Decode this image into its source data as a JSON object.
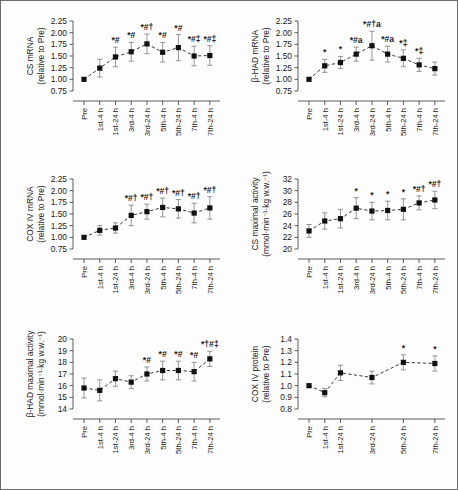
{
  "figure": {
    "name": "six-panel-exercise-training-figure",
    "background": "#ffffff",
    "border_color": "#6b6b6b",
    "marker_color": "#111111",
    "error_color": "#8a8a8a",
    "line_style": "dashed"
  },
  "chart_data": [
    {
      "id": "cs-mrna",
      "type": "line",
      "title": "",
      "ylabel": "CS mRNA\n(relative to Pre)",
      "ylabel_line1": "CS mRNA",
      "ylabel_line2": "(relative to Pre)",
      "xlabel": "",
      "ylim": [
        0.75,
        2.25
      ],
      "yticks": [
        0.75,
        1.0,
        1.25,
        1.5,
        1.75,
        2.0,
        2.25
      ],
      "ytick_labels": [
        "0.75",
        "1.00",
        "1.25",
        "1.50",
        "1.75",
        "2.00",
        "2.25"
      ],
      "categories": [
        "Pre",
        "1st-4 h",
        "1st-24 h",
        "3rd-4 h",
        "3rd-24 h",
        "5th-4 h",
        "5th-24 h",
        "7th-4 h",
        "7th-24 h"
      ],
      "values": [
        1.0,
        1.24,
        1.48,
        1.59,
        1.76,
        1.58,
        1.68,
        1.5,
        1.51
      ],
      "err_low": [
        0.0,
        0.19,
        0.21,
        0.2,
        0.21,
        0.21,
        0.28,
        0.21,
        0.21
      ],
      "err_high": [
        0.0,
        0.19,
        0.21,
        0.2,
        0.21,
        0.21,
        0.28,
        0.21,
        0.21
      ],
      "annotations": [
        "",
        "",
        "*#",
        "*#",
        "*#†",
        "*#",
        "*#",
        "*#‡",
        "*#‡"
      ],
      "grid": false,
      "legend": "none"
    },
    {
      "id": "bhad-mrna",
      "type": "line",
      "ylabel_line1": "β-HAD mRNA",
      "ylabel_line2": "(relative to Pre)",
      "ylim": [
        0.75,
        2.25
      ],
      "yticks": [
        0.75,
        1.0,
        1.25,
        1.5,
        1.75,
        2.0,
        2.25
      ],
      "ytick_labels": [
        "0.75",
        "1.00",
        "1.25",
        "1.50",
        "1.75",
        "2.00",
        "2.25"
      ],
      "categories": [
        "Pre",
        "1st-4 h",
        "1st-24 h",
        "3rd-4 h",
        "3rd-24 h",
        "5th-4 h",
        "5th-24 h",
        "7th-4 h",
        "7th-24 h"
      ],
      "values": [
        1.0,
        1.29,
        1.36,
        1.54,
        1.72,
        1.54,
        1.45,
        1.31,
        1.23
      ],
      "err_low": [
        0.0,
        0.14,
        0.13,
        0.15,
        0.31,
        0.17,
        0.18,
        0.14,
        0.14
      ],
      "err_high": [
        0.0,
        0.14,
        0.13,
        0.15,
        0.31,
        0.17,
        0.18,
        0.14,
        0.14
      ],
      "annotations": [
        "",
        "*",
        "*",
        "*#a",
        "*#†a",
        "*#a",
        "*‡",
        "*‡",
        ""
      ],
      "grid": false,
      "legend": "none"
    },
    {
      "id": "coxiv-mrna",
      "type": "line",
      "ylabel_line1": "COX IV mRNA",
      "ylabel_line2": "(relative to Pre)",
      "ylim": [
        0.75,
        2.25
      ],
      "yticks": [
        0.75,
        1.0,
        1.25,
        1.5,
        1.75,
        2.0,
        2.25
      ],
      "ytick_labels": [
        "0.75",
        "1.00",
        "1.25",
        "1.50",
        "1.75",
        "2.00",
        "2.25"
      ],
      "categories": [
        "Pre",
        "1st-4 h",
        "1st-24 h",
        "3rd-4 h",
        "3rd-24 h",
        "5th-4 h",
        "5th-24 h",
        "7th-4 h",
        "7th-24 h"
      ],
      "values": [
        1.0,
        1.15,
        1.2,
        1.47,
        1.55,
        1.64,
        1.61,
        1.52,
        1.63
      ],
      "err_low": [
        0.0,
        0.1,
        0.11,
        0.22,
        0.16,
        0.2,
        0.2,
        0.21,
        0.24
      ],
      "err_high": [
        0.0,
        0.1,
        0.11,
        0.22,
        0.16,
        0.2,
        0.2,
        0.21,
        0.24
      ],
      "annotations": [
        "",
        "",
        "",
        "*#†",
        "*#†",
        "*#†",
        "*#†",
        "*#†",
        "*#†"
      ],
      "grid": false,
      "legend": "none"
    },
    {
      "id": "cs-maximal-activity",
      "type": "line",
      "ylabel_line1": "CS maximal activity",
      "ylabel_line2": "(mmol·min⁻¹·kg w.w.⁻¹)",
      "ylim": [
        20,
        32
      ],
      "yticks": [
        20,
        22,
        24,
        26,
        28,
        30,
        32
      ],
      "ytick_labels": [
        "20",
        "22",
        "24",
        "26",
        "28",
        "30",
        "32"
      ],
      "categories": [
        "Pre",
        "1st-4 h",
        "1st-24 h",
        "3rd-4 h",
        "3rd-24 h",
        "5th-4 h",
        "5th-24 h",
        "7th-4 h",
        "7th-24 h"
      ],
      "values": [
        23.1,
        24.8,
        25.2,
        27.0,
        26.5,
        26.6,
        26.8,
        27.9,
        28.4
      ],
      "err_low": [
        1.1,
        1.4,
        1.6,
        1.8,
        1.5,
        1.6,
        1.8,
        1.2,
        1.5
      ],
      "err_high": [
        1.1,
        1.4,
        1.6,
        1.8,
        1.5,
        1.6,
        1.8,
        1.2,
        1.5
      ],
      "annotations": [
        "",
        "",
        "",
        "*",
        "*",
        "*",
        "*",
        "*#†",
        "*#†"
      ],
      "grid": false,
      "legend": "none"
    },
    {
      "id": "bhad-maximal-activity",
      "type": "line",
      "ylabel_line1": "β-HAD maximal activity",
      "ylabel_line2": "(mmol·min⁻¹·kg w.w.⁻¹)",
      "ylim": [
        14,
        20
      ],
      "yticks": [
        14,
        15,
        16,
        17,
        18,
        19,
        20
      ],
      "ytick_labels": [
        "14",
        "15",
        "16",
        "17",
        "18",
        "19",
        "20"
      ],
      "categories": [
        "Pre",
        "1st-4 h",
        "1st-24 h",
        "3rd-4 h",
        "3rd-24 h",
        "5th-4 h",
        "5th-24 h",
        "7th-4 h",
        "7th-24 h"
      ],
      "values": [
        15.8,
        15.6,
        16.6,
        16.3,
        17.0,
        17.3,
        17.3,
        17.2,
        18.3
      ],
      "err_low": [
        0.85,
        0.9,
        0.65,
        0.55,
        0.6,
        0.8,
        0.8,
        0.8,
        0.65
      ],
      "err_high": [
        0.85,
        0.9,
        0.65,
        0.55,
        0.6,
        0.8,
        0.8,
        0.8,
        0.65
      ],
      "annotations": [
        "",
        "",
        "",
        "",
        "*#",
        "*#",
        "*#",
        "*#",
        "*†#‡"
      ],
      "grid": false,
      "legend": "none"
    },
    {
      "id": "coxiv-protein",
      "type": "line",
      "ylabel_line1": "COX IV protein",
      "ylabel_line2": "(relative to Pre)",
      "ylim": [
        0.8,
        1.4
      ],
      "yticks": [
        0.8,
        0.9,
        1.0,
        1.1,
        1.2,
        1.3,
        1.4
      ],
      "ytick_labels": [
        "0.8",
        "0.9",
        "1.0",
        "1.1",
        "1.2",
        "1.3",
        "1.4"
      ],
      "categories": [
        "Pre",
        "1st-4 h",
        "1st-24 h",
        "3rd-24 h",
        "5th-24 h",
        "7th-24 h"
      ],
      "values": [
        1.0,
        0.94,
        1.11,
        1.07,
        1.2,
        1.19
      ],
      "err_low": [
        0.0,
        0.035,
        0.065,
        0.055,
        0.065,
        0.065
      ],
      "err_high": [
        0.0,
        0.035,
        0.065,
        0.055,
        0.065,
        0.065
      ],
      "annotations": [
        "",
        "",
        "",
        "",
        "*",
        "*"
      ],
      "grid": false,
      "legend": "none",
      "xpositions": [
        0,
        1,
        2,
        4,
        6,
        8
      ]
    }
  ]
}
